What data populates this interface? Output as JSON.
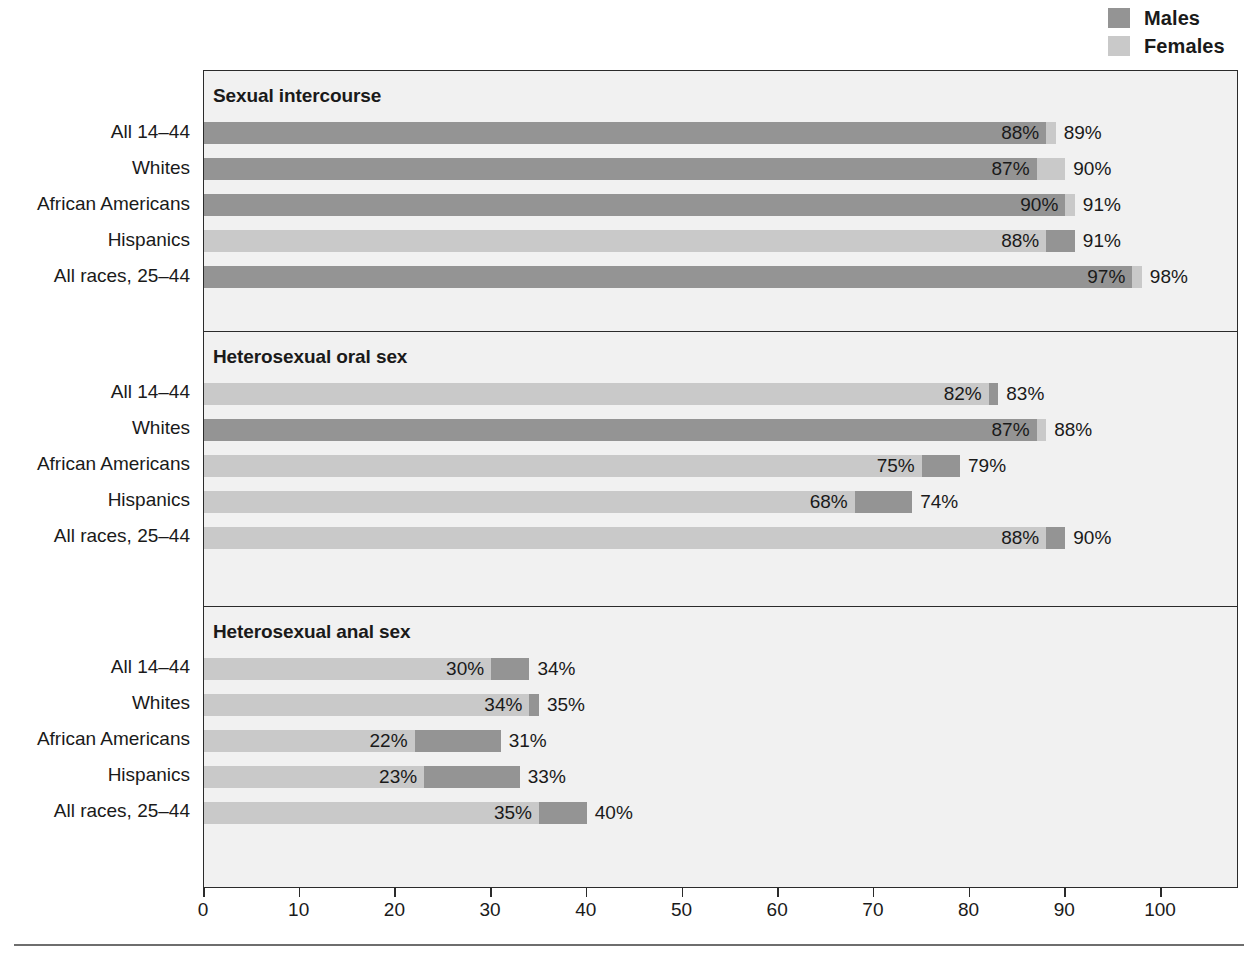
{
  "legend": {
    "items": [
      {
        "label": "Males",
        "color": "#949494",
        "name": "males"
      },
      {
        "label": "Females",
        "color": "#c9c9c9",
        "name": "females"
      }
    ]
  },
  "axis": {
    "ticks": [
      "0",
      "10",
      "20",
      "30",
      "40",
      "50",
      "60",
      "70",
      "80",
      "90",
      "100"
    ]
  },
  "chart_data": {
    "type": "bar",
    "orientation": "horizontal",
    "title": "",
    "xlabel": "",
    "ylabel": "",
    "xlim": [
      0,
      100
    ],
    "xticks": [
      0,
      10,
      20,
      30,
      40,
      50,
      60,
      70,
      80,
      90,
      100
    ],
    "grid": false,
    "legend_position": "top-right",
    "note": "Overlaid horizontal bars: the larger of the two values is drawn behind, the smaller in front, both starting at 0.",
    "series": [
      {
        "name": "Males",
        "color": "#949494"
      },
      {
        "name": "Females",
        "color": "#c9c9c9"
      }
    ],
    "categories": [
      "All 14–44",
      "Whites",
      "African Americans",
      "Hispanics",
      "All races, 25–44"
    ],
    "panels": [
      {
        "title": "Sexual intercourse",
        "rows": [
          {
            "category": "All 14–44",
            "males": 88,
            "females": 89,
            "males_label": "88%",
            "females_label": "89%"
          },
          {
            "category": "Whites",
            "males": 87,
            "females": 90,
            "males_label": "87%",
            "females_label": "90%"
          },
          {
            "category": "African Americans",
            "males": 90,
            "females": 91,
            "males_label": "90%",
            "females_label": "91%"
          },
          {
            "category": "Hispanics",
            "males": 91,
            "females": 88,
            "males_label": "91%",
            "females_label": "88%"
          },
          {
            "category": "All races, 25–44",
            "males": 97,
            "females": 98,
            "males_label": "97%",
            "females_label": "98%"
          }
        ]
      },
      {
        "title": "Heterosexual oral sex",
        "rows": [
          {
            "category": "All 14–44",
            "males": 83,
            "females": 82,
            "males_label": "83%",
            "females_label": "82%"
          },
          {
            "category": "Whites",
            "males": 87,
            "females": 88,
            "males_label": "87%",
            "females_label": "88%"
          },
          {
            "category": "African Americans",
            "males": 79,
            "females": 75,
            "males_label": "79%",
            "females_label": "75%"
          },
          {
            "category": "Hispanics",
            "males": 74,
            "females": 68,
            "males_label": "74%",
            "females_label": "68%"
          },
          {
            "category": "All races, 25–44",
            "males": 90,
            "females": 88,
            "males_label": "90%",
            "females_label": "88%"
          }
        ]
      },
      {
        "title": "Heterosexual anal sex",
        "rows": [
          {
            "category": "All 14–44",
            "males": 34,
            "females": 30,
            "males_label": "34%",
            "females_label": "30%"
          },
          {
            "category": "Whites",
            "males": 35,
            "females": 34,
            "males_label": "35%",
            "females_label": "34%"
          },
          {
            "category": "African Americans",
            "males": 31,
            "females": 22,
            "males_label": "31%",
            "females_label": "22%"
          },
          {
            "category": "Hispanics",
            "males": 33,
            "females": 23,
            "males_label": "33%",
            "females_label": "23%"
          },
          {
            "category": "All races, 25–44",
            "males": 40,
            "females": 35,
            "males_label": "40%",
            "females_label": "35%"
          }
        ]
      }
    ]
  }
}
